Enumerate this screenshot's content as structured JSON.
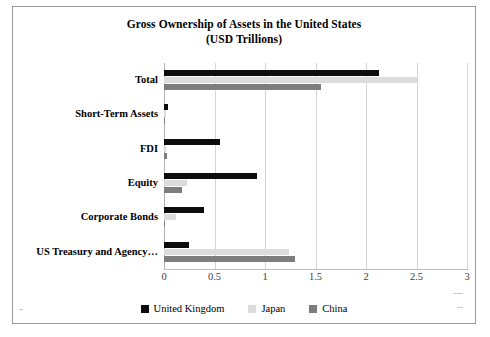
{
  "chart_data": {
    "type": "bar",
    "orientation": "horizontal",
    "title": "Gross Ownership of Assets in the United States",
    "subtitle": "(USD Trillions)",
    "xlabel": "",
    "ylabel": "",
    "xlim": [
      0,
      3
    ],
    "xticks": [
      "0",
      "0.5",
      "1",
      "1.5",
      "2",
      "2.5",
      "3"
    ],
    "xtick_values": [
      0,
      0.5,
      1,
      1.5,
      2,
      2.5,
      3
    ],
    "grid": true,
    "legend_position": "bottom",
    "categories": [
      "Total",
      "Short-Term Assets",
      "FDI",
      "Equity",
      "Corporate Bonds",
      "US Treasury and Agency…"
    ],
    "series": [
      {
        "name": "United Kingdom",
        "color": "#0c0c0c",
        "values": [
          2.13,
          0.04,
          0.55,
          0.92,
          0.4,
          0.25
        ]
      },
      {
        "name": "Japan",
        "color": "#dcdcdc",
        "values": [
          2.5,
          0.02,
          0.02,
          0.23,
          0.12,
          1.24
        ]
      },
      {
        "name": "China",
        "color": "#7e7e7e",
        "values": [
          1.55,
          0.01,
          0.03,
          0.18,
          0.01,
          1.3
        ]
      }
    ]
  },
  "legend": {
    "items": [
      {
        "label": "United Kingdom",
        "color": "#0c0c0c"
      },
      {
        "label": "Japan",
        "color": "#dcdcdc"
      },
      {
        "label": "China",
        "color": "#7e7e7e"
      }
    ]
  }
}
